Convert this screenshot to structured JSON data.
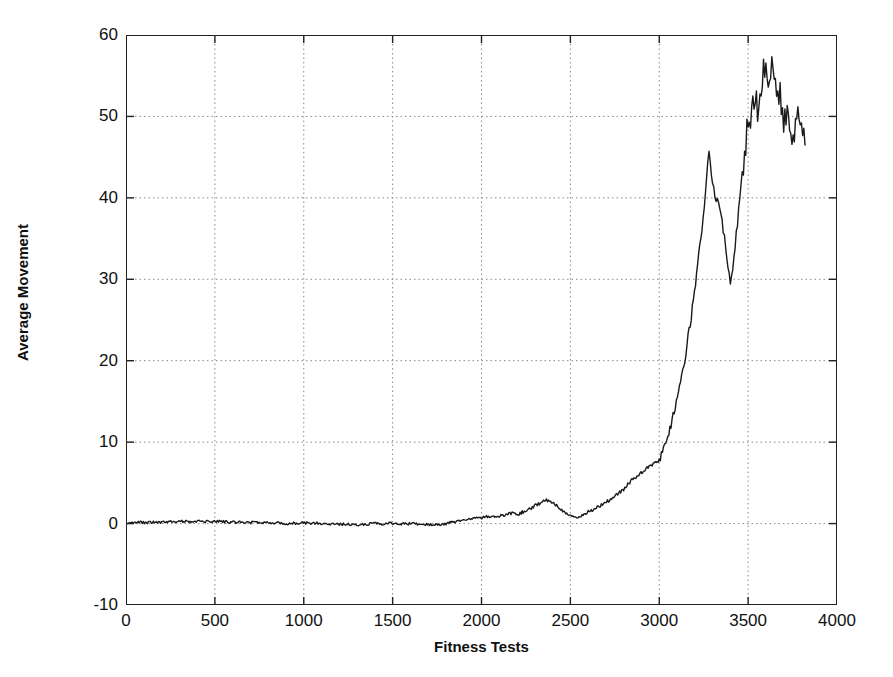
{
  "chart_data": {
    "type": "line",
    "title": "",
    "subtitle": "",
    "xlabel": "Fitness Tests",
    "ylabel": "Average Movement",
    "xlim": [
      0,
      4000
    ],
    "ylim": [
      -10,
      60
    ],
    "xticks": [
      0,
      500,
      1000,
      1500,
      2000,
      2500,
      3000,
      3500,
      4000
    ],
    "yticks": [
      -10,
      0,
      10,
      20,
      30,
      40,
      50,
      60
    ],
    "xtick_labels": [
      "0",
      "500",
      "1000",
      "1500",
      "2000",
      "2500",
      "3000",
      "3500",
      "4000"
    ],
    "ytick_labels": [
      "-10",
      "0",
      "10",
      "20",
      "30",
      "40",
      "50",
      "60"
    ],
    "grid": true,
    "grid_style": "dotted",
    "grid_color": "#8a8a8a",
    "legend": null,
    "line_color": "#1a1a1a",
    "line_width": 1.4,
    "series": [
      {
        "name": "Average Movement",
        "x": [
          0,
          40,
          80,
          120,
          160,
          200,
          240,
          280,
          320,
          360,
          400,
          440,
          480,
          520,
          560,
          600,
          640,
          680,
          720,
          760,
          800,
          840,
          880,
          920,
          960,
          1000,
          1040,
          1080,
          1120,
          1160,
          1200,
          1240,
          1280,
          1320,
          1360,
          1400,
          1440,
          1480,
          1520,
          1560,
          1600,
          1640,
          1680,
          1720,
          1760,
          1800,
          1840,
          1880,
          1920,
          1960,
          2000,
          2040,
          2080,
          2120,
          2160,
          2200,
          2240,
          2280,
          2320,
          2360,
          2400,
          2440,
          2480,
          2520,
          2560,
          2600,
          2640,
          2680,
          2720,
          2760,
          2800,
          2840,
          2880,
          2920,
          2960,
          3000,
          3030,
          3060,
          3090,
          3120,
          3150,
          3180,
          3210,
          3240,
          3260,
          3280,
          3300,
          3320,
          3340,
          3360,
          3380,
          3400,
          3420,
          3440,
          3460,
          3480,
          3500,
          3520,
          3540,
          3560,
          3580,
          3600,
          3620,
          3640,
          3660,
          3680,
          3700,
          3720,
          3740,
          3760,
          3780,
          3800,
          3820
        ],
        "y": [
          0.0,
          0.1,
          0.15,
          0.1,
          0.2,
          0.15,
          0.25,
          0.2,
          0.3,
          0.25,
          0.3,
          0.25,
          0.2,
          0.3,
          0.2,
          0.15,
          0.2,
          0.1,
          0.15,
          0.1,
          0.05,
          0.1,
          0.05,
          0.0,
          0.05,
          0.1,
          0.0,
          0.05,
          -0.05,
          0.0,
          -0.1,
          -0.05,
          -0.15,
          -0.1,
          -0.05,
          0.0,
          -0.05,
          0.05,
          0.0,
          -0.05,
          0.0,
          -0.1,
          -0.05,
          -0.15,
          -0.1,
          0.0,
          0.2,
          0.35,
          0.5,
          0.6,
          0.7,
          0.9,
          0.85,
          1.0,
          1.3,
          1.1,
          1.5,
          1.9,
          2.4,
          2.9,
          2.6,
          1.9,
          1.2,
          0.7,
          0.9,
          1.4,
          1.9,
          2.3,
          2.9,
          3.5,
          4.2,
          5.2,
          6.0,
          6.6,
          7.2,
          7.8,
          9.6,
          11.5,
          14.5,
          17.5,
          21.0,
          25.5,
          30.5,
          36.0,
          41.0,
          46.0,
          41.5,
          40.0,
          38.5,
          36.0,
          33.0,
          29.5,
          32.5,
          37.0,
          41.5,
          45.5,
          49.5,
          50.5,
          53.0,
          50.0,
          55.0,
          56.5,
          53.5,
          57.0,
          54.0,
          52.5,
          49.5,
          50.5,
          47.0,
          48.5,
          50.0,
          49.5,
          46.5
        ]
      }
    ]
  }
}
